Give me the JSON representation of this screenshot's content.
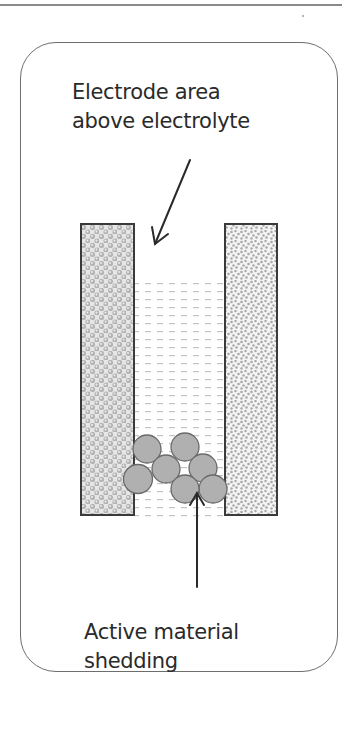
{
  "figure": {
    "type": "battery cell failure diagram",
    "labels": {
      "top": {
        "line1": "Electrode area",
        "line2": "above electrolyte"
      },
      "bottom": {
        "line1": "Active material",
        "line2": "shedding"
      }
    },
    "elements": {
      "left_electrode": {
        "pattern": "bubbles",
        "color": "#b8b8b8"
      },
      "right_electrode": {
        "pattern": "speckle",
        "color": "#a8a8a8"
      },
      "electrolyte": {
        "pattern": "dashes",
        "color": "#c4c4c4"
      },
      "shed_particles": {
        "count": 7,
        "fill": "#b0b0b0",
        "stroke": "#6a6a6a"
      }
    },
    "colors": {
      "outline": "#3a3a3a",
      "frame": "#6e6e6e",
      "text": "#2a2a2a"
    }
  }
}
